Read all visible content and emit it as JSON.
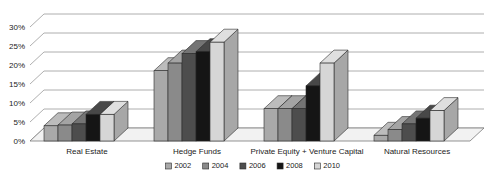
{
  "chart_data": {
    "type": "bar",
    "title": "",
    "subtitle": "",
    "xlabel": "",
    "ylabel": "",
    "ylim": [
      0,
      30
    ],
    "ytick_labels": [
      "0%",
      "5%",
      "10%",
      "15%",
      "20%",
      "25%",
      "30%"
    ],
    "ytick_values": [
      0,
      5,
      10,
      15,
      20,
      25,
      30
    ],
    "grid": true,
    "grid_axis": "y",
    "legend_position": "bottom",
    "style": "3d-perspective-grouped-bars",
    "categories": [
      "Real Estate",
      "Hedge Funds",
      "Private Equity + Venture Capital",
      "Natural Resources"
    ],
    "series": [
      {
        "name": "2002",
        "color": "#a9a9a9",
        "values": [
          4.0,
          18.5,
          8.5,
          1.5
        ]
      },
      {
        "name": "2004",
        "color": "#8a8a8a",
        "values": [
          4.2,
          20.5,
          8.5,
          3.0
        ]
      },
      {
        "name": "2006",
        "color": "#4d4d4d",
        "values": [
          4.5,
          23.0,
          8.5,
          4.5
        ]
      },
      {
        "name": "2008",
        "color": "#151515",
        "values": [
          7.0,
          23.5,
          14.5,
          6.0
        ]
      },
      {
        "name": "2010",
        "color": "#d6d6d6",
        "values": [
          7.0,
          26.0,
          20.5,
          8.0
        ]
      }
    ]
  },
  "legend": {
    "entries": [
      {
        "label": "2002",
        "color": "#a9a9a9"
      },
      {
        "label": "2004",
        "color": "#8a8a8a"
      },
      {
        "label": "2006",
        "color": "#4d4d4d"
      },
      {
        "label": "2008",
        "color": "#151515"
      },
      {
        "label": "2010",
        "color": "#d6d6d6"
      }
    ]
  },
  "colors": {
    "background": "#ffffff",
    "gridline": "#9a9a9a",
    "floor": "#f2f2f2",
    "text": "#1b1b1b",
    "bar_outline": "#2b2b2b"
  }
}
